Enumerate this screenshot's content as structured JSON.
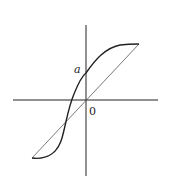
{
  "diagram": {
    "type": "function-plot",
    "labels": {
      "y_intercept": "a",
      "origin": "0"
    },
    "elements": [
      {
        "name": "x-axis",
        "kind": "line"
      },
      {
        "name": "y-axis",
        "kind": "line"
      },
      {
        "name": "s-curve",
        "kind": "curve",
        "description": "S-shaped increasing curve crossing the y-axis at a"
      },
      {
        "name": "chord",
        "kind": "line",
        "description": "straight line through the origin joining the curve endpoints"
      }
    ],
    "colors": {
      "axes": "#222222",
      "curve": "#222222",
      "chord": "#555555"
    }
  }
}
